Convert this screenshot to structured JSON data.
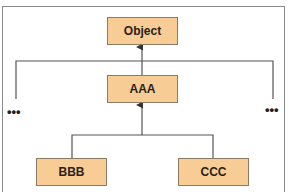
{
  "diagram": {
    "nodes": {
      "object": "Object",
      "aaa": "AAA",
      "bbb": "BBB",
      "ccc": "CCC"
    },
    "ellipsis_left": "•••",
    "ellipsis_right": "•••",
    "edges": [
      {
        "from": "AAA",
        "to": "Object",
        "type": "inheritance-arrow"
      },
      {
        "from": "BBB",
        "to": "AAA",
        "type": "inheritance-arrow"
      },
      {
        "from": "CCC",
        "to": "AAA",
        "type": "inheritance-arrow"
      }
    ],
    "colors": {
      "box_fill": "#f7cd95",
      "box_border": "#8d7a62",
      "line": "#555555"
    }
  }
}
